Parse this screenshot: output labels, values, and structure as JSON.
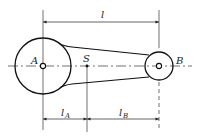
{
  "diagram": {
    "type": "connecting-rod schematic",
    "labels": {
      "point_a": "A",
      "point_b": "B",
      "center_of_mass": "S",
      "total_length": "l",
      "length_a_main": "l",
      "length_a_sub": "A",
      "length_b_main": "l",
      "length_b_sub": "B"
    },
    "colors": {
      "stroke": "#222222",
      "background": "#ffffff"
    }
  }
}
